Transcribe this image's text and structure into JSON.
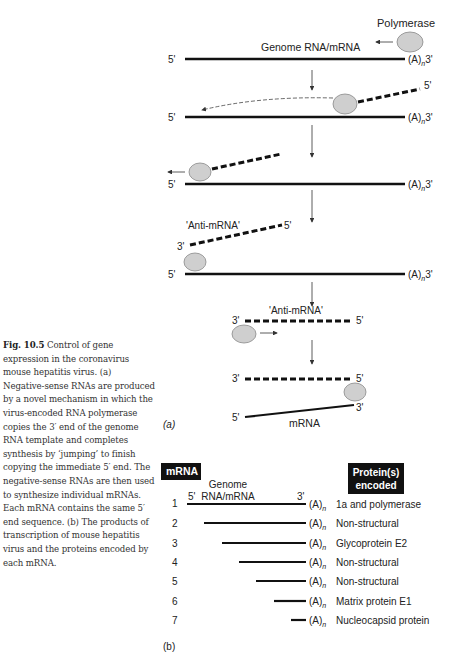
{
  "caption": {
    "label": "Fig. 10.5",
    "text": "Control of gene expression in the coronavirus mouse hepatitis virus. (a) Negative-sense RNAs are produced by a novel mechanism in which the virus-encoded RNA polymerase copies the 3′ end of the genome RNA template and completes synthesis by ‘jumping’ to finish copying the immediate 5′ end. The negative-sense RNAs are then used to synthesize individual mRNAs. Each mRNA contains the same 5′ end sequence. (b) The products of transcription of mouse hepatitis virus and the proteins encoded by each mRNA."
  },
  "panel_a": {
    "label": "(a)",
    "polymerase_label": "Polymerase",
    "genome_label": "Genome RNA/mRNA",
    "five_prime": "5'",
    "three_prime": "3'",
    "polyA": "(A)",
    "polyA_sub": "n",
    "polyA_end": "3'",
    "anti_mrna_label": "'Anti-mRNA'",
    "mrna_label": "mRNA",
    "polymerase_color": "#cfcfcf"
  },
  "panel_b": {
    "label": "(b)",
    "header_mrna": "mRNA",
    "header_protein_line1": "Protein(s)",
    "header_protein_line2": "encoded",
    "genome_line1": "Genome",
    "genome_line2": "RNA/mRNA",
    "five_prime": "5'",
    "three_prime": "3'",
    "polyA": "(A)",
    "polyA_sub": "n",
    "rows": [
      {
        "num": "1",
        "protein": "1a and polymerase"
      },
      {
        "num": "2",
        "protein": "Non-structural"
      },
      {
        "num": "3",
        "protein": "Glycoprotein E2"
      },
      {
        "num": "4",
        "protein": "Non-structural"
      },
      {
        "num": "5",
        "protein": "Non-structural"
      },
      {
        "num": "6",
        "protein": "Matrix protein E1"
      },
      {
        "num": "7",
        "protein": "Nucleocapsid protein"
      }
    ]
  }
}
